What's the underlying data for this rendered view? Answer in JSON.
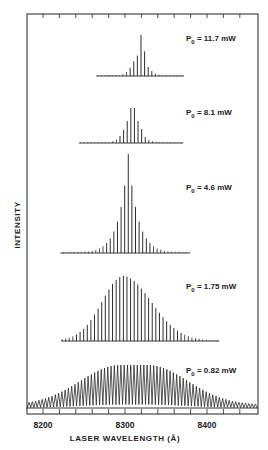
{
  "chart_data": {
    "type": "line",
    "subtype": "stacked spectra (longitudinal mode spectra)",
    "title": "",
    "xlabel": "LASER WAVELENGTH (Å)",
    "ylabel": "INTENSITY",
    "xlim": [
      8180,
      8462
    ],
    "x_ticks_major": [
      8200,
      8300,
      8400
    ],
    "x_tick_labels": [
      "8200",
      "8300",
      "8400"
    ],
    "x_minor_tick_step": 20,
    "grid": false,
    "legend": "none (inline labels per trace)",
    "series": [
      {
        "name": "P0 = 11.7 mW",
        "label": "P",
        "label_sub": "0",
        "label_rest": " = 11.7 mW",
        "baseline_y": 76,
        "label_y": 41,
        "range": [
          8265,
          8372
        ],
        "mode_spacing": 4.4,
        "peak_wavelength": 8319.5,
        "peak_height_px": 41,
        "envelope": "narrow",
        "relative_modes": [
          {
            "offset": -5,
            "h": 0.04
          },
          {
            "offset": -4,
            "h": 0.1
          },
          {
            "offset": -3,
            "h": 0.2
          },
          {
            "offset": -2,
            "h": 0.36
          },
          {
            "offset": -1,
            "h": 0.5
          },
          {
            "offset": 0,
            "h": 1.0
          },
          {
            "offset": 1,
            "h": 0.6
          },
          {
            "offset": 2,
            "h": 0.22
          },
          {
            "offset": 3,
            "h": 0.12
          },
          {
            "offset": 4,
            "h": 0.06
          },
          {
            "offset": 5,
            "h": 0.03
          }
        ]
      },
      {
        "name": "P0 = 8.1 mW",
        "label": "P",
        "label_sub": "0",
        "label_rest": " = 8.1 mW",
        "baseline_y": 143,
        "label_y": 115,
        "range": [
          8244,
          8371
        ],
        "mode_spacing": 4.4,
        "peak_wavelength": 8311.5,
        "peak_height_px": 35,
        "envelope": "narrow, twin central modes",
        "relative_modes": [
          {
            "offset": -6,
            "h": 0.05
          },
          {
            "offset": -5,
            "h": 0.1
          },
          {
            "offset": -4,
            "h": 0.2
          },
          {
            "offset": -3,
            "h": 0.37
          },
          {
            "offset": -2,
            "h": 0.63
          },
          {
            "offset": -1,
            "h": 1.0
          },
          {
            "offset": 0,
            "h": 1.0
          },
          {
            "offset": 1,
            "h": 0.63
          },
          {
            "offset": 2,
            "h": 0.4
          },
          {
            "offset": 3,
            "h": 0.17
          },
          {
            "offset": 4,
            "h": 0.09
          },
          {
            "offset": 5,
            "h": 0.05
          },
          {
            "offset": 6,
            "h": 0.03
          }
        ]
      },
      {
        "name": "P0 = 4.6 mW",
        "label": "P",
        "label_sub": "0",
        "label_rest": " = 4.6 mW",
        "baseline_y": 253,
        "label_y": 190,
        "range": [
          8221,
          8379
        ],
        "mode_spacing": 4.4,
        "peak_wavelength": 8304,
        "peak_height_px": 99,
        "envelope": "sharp central, exponential-like wings"
      },
      {
        "name": "P0 = 1.75 mW",
        "label": "P",
        "label_sub": "0",
        "label_rest": " = 1.75 mW",
        "baseline_y": 341,
        "label_y": 289,
        "range": [
          8222,
          8415
        ],
        "mode_spacing": 4.4,
        "peak_wavelength": 8298,
        "peak_height_px": 65,
        "envelope": "broad, slightly skewed"
      },
      {
        "name": "P0 = 0.82 mW",
        "label": "P",
        "label_sub": "0",
        "label_rest": " = 0.82 mW",
        "baseline_y": 408,
        "label_y": 373,
        "range": [
          8180,
          8462
        ],
        "mode_spacing": 4.0,
        "peak_wavelength": 8311,
        "peak_height_px": 43,
        "envelope": "very broad, flat-topped plateau 8294–8328"
      }
    ]
  },
  "axes": {
    "x_title": "LASER WAVELENGTH (Å)",
    "y_title": "INTENSITY",
    "tick_labels": [
      "8200",
      "8300",
      "8400"
    ]
  }
}
